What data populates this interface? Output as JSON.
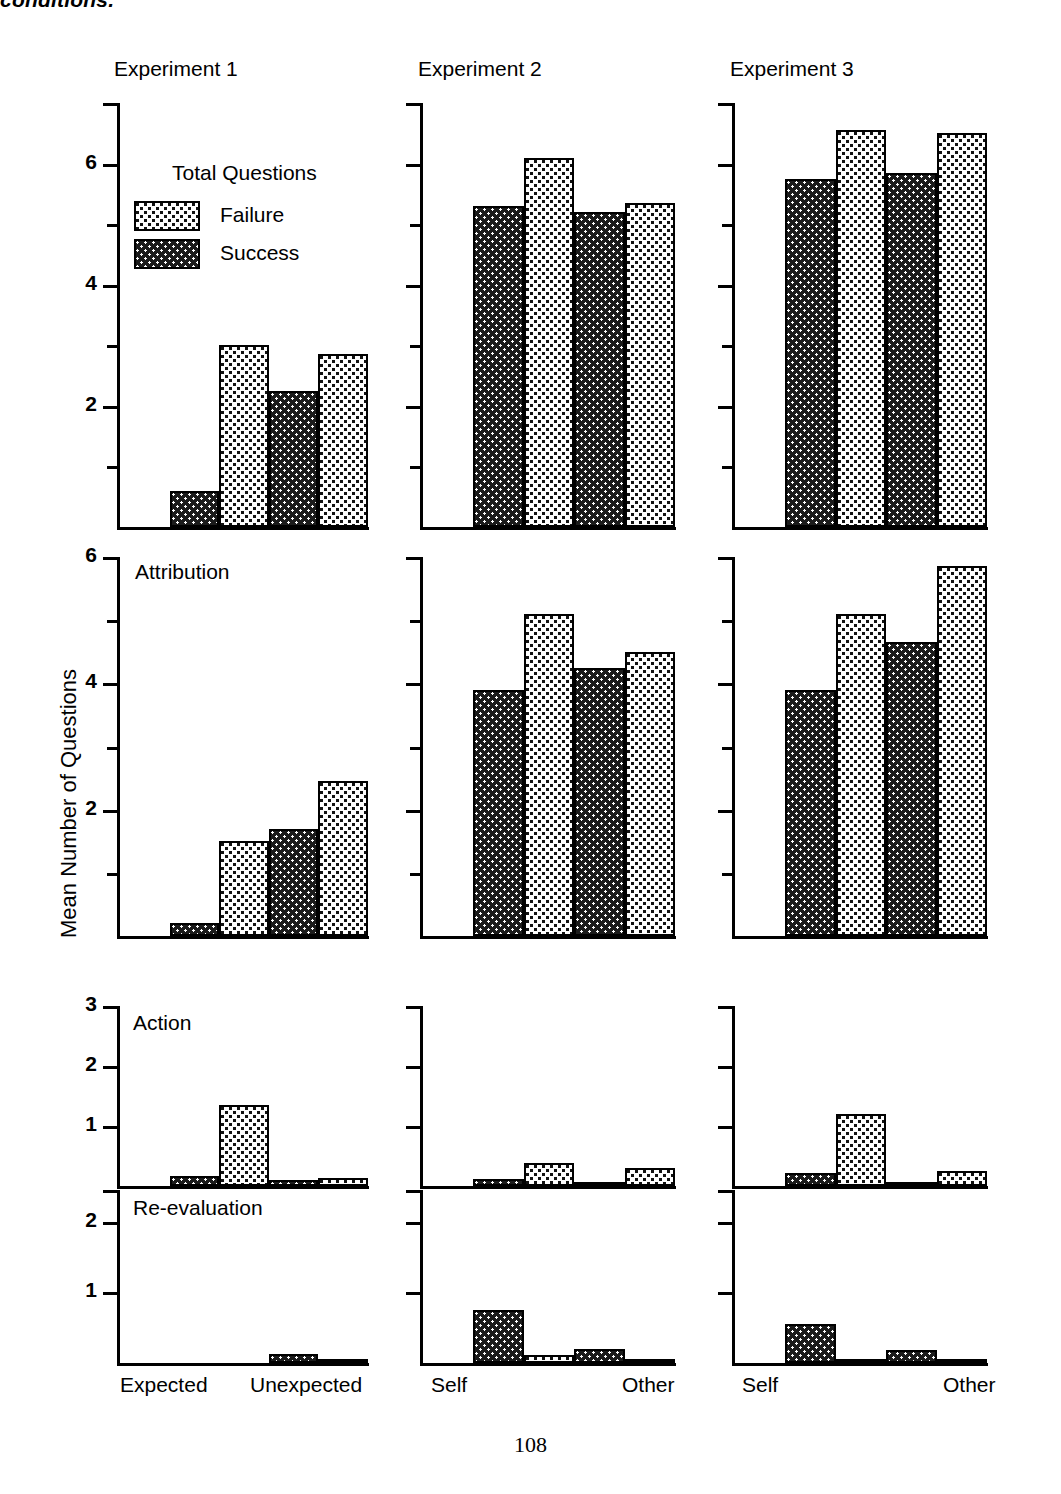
{
  "caption": {
    "clipped_text": "conditions."
  },
  "page_number": "108",
  "axis": {
    "ylabel": "Mean Number of Questions"
  },
  "legend": {
    "title": "Total Questions",
    "entries": [
      {
        "label": "Failure",
        "pattern": "light-dotted"
      },
      {
        "label": "Success",
        "pattern": "dark-dotted"
      }
    ]
  },
  "columns": [
    {
      "title": "Experiment 1",
      "x_labels": [
        "Expected",
        "Unexpected"
      ]
    },
    {
      "title": "Experiment 2",
      "x_labels": [
        "Self",
        "Other"
      ]
    },
    {
      "title": "Experiment 3",
      "x_labels": [
        "Self",
        "Other"
      ]
    }
  ],
  "rows": [
    {
      "title": "",
      "ymax": 7,
      "major_ticks": [
        2,
        4,
        6
      ],
      "minor_ticks": [
        1,
        3,
        5
      ]
    },
    {
      "title": "Attribution",
      "ymax": 6,
      "major_ticks": [
        2,
        4,
        6
      ],
      "minor_ticks": [
        1,
        3,
        5
      ]
    },
    {
      "title": "Action",
      "ymax": 3,
      "major_ticks": [
        1,
        2,
        3
      ],
      "minor_ticks": []
    },
    {
      "title": "Re-evaluation",
      "ymax": 2.45,
      "major_ticks": [
        1,
        2
      ],
      "minor_ticks": []
    }
  ],
  "chart_data": {
    "type": "bar",
    "xlabel": "",
    "ylabel": "Mean Number of Questions",
    "grid": false,
    "legend_position": "inside-top-left-of-panel-1-row-1",
    "legend_title": "Total Questions",
    "series": [
      {
        "name": "Success",
        "pattern": "dark-dotted"
      },
      {
        "name": "Failure",
        "pattern": "light-dotted"
      }
    ],
    "bar_order": [
      "Success",
      "Failure",
      "Success",
      "Failure"
    ],
    "panels": [
      {
        "row": "Total Questions",
        "ylim": [
          0,
          7
        ],
        "yticks": [
          2,
          4,
          6
        ],
        "columns": [
          {
            "experiment": "Experiment 1",
            "groups": [
              "Expected",
              "Unexpected"
            ],
            "values": [
              {
                "group": "Expected",
                "series": "Success",
                "value": 0.6
              },
              {
                "group": "Expected",
                "series": "Failure",
                "value": 3.0
              },
              {
                "group": "Unexpected",
                "series": "Success",
                "value": 2.25
              },
              {
                "group": "Unexpected",
                "series": "Failure",
                "value": 2.85
              }
            ]
          },
          {
            "experiment": "Experiment 2",
            "groups": [
              "Self",
              "Other"
            ],
            "values": [
              {
                "group": "Self",
                "series": "Success",
                "value": 5.3
              },
              {
                "group": "Self",
                "series": "Failure",
                "value": 6.1
              },
              {
                "group": "Other",
                "series": "Success",
                "value": 5.2
              },
              {
                "group": "Other",
                "series": "Failure",
                "value": 5.35
              }
            ]
          },
          {
            "experiment": "Experiment 3",
            "groups": [
              "Self",
              "Other"
            ],
            "values": [
              {
                "group": "Self",
                "series": "Success",
                "value": 5.75
              },
              {
                "group": "Self",
                "series": "Failure",
                "value": 6.55
              },
              {
                "group": "Other",
                "series": "Success",
                "value": 5.85
              },
              {
                "group": "Other",
                "series": "Failure",
                "value": 6.5
              }
            ]
          }
        ]
      },
      {
        "row": "Attribution",
        "ylim": [
          0,
          6
        ],
        "yticks": [
          2,
          4,
          6
        ],
        "columns": [
          {
            "experiment": "Experiment 1",
            "groups": [
              "Expected",
              "Unexpected"
            ],
            "values": [
              {
                "group": "Expected",
                "series": "Success",
                "value": 0.2
              },
              {
                "group": "Expected",
                "series": "Failure",
                "value": 1.5
              },
              {
                "group": "Unexpected",
                "series": "Success",
                "value": 1.7
              },
              {
                "group": "Unexpected",
                "series": "Failure",
                "value": 2.45
              }
            ]
          },
          {
            "experiment": "Experiment 2",
            "groups": [
              "Self",
              "Other"
            ],
            "values": [
              {
                "group": "Self",
                "series": "Success",
                "value": 3.9
              },
              {
                "group": "Self",
                "series": "Failure",
                "value": 5.1
              },
              {
                "group": "Other",
                "series": "Success",
                "value": 4.25
              },
              {
                "group": "Other",
                "series": "Failure",
                "value": 4.5
              }
            ]
          },
          {
            "experiment": "Experiment 3",
            "groups": [
              "Self",
              "Other"
            ],
            "values": [
              {
                "group": "Self",
                "series": "Success",
                "value": 3.9
              },
              {
                "group": "Self",
                "series": "Failure",
                "value": 5.1
              },
              {
                "group": "Other",
                "series": "Success",
                "value": 4.65
              },
              {
                "group": "Other",
                "series": "Failure",
                "value": 5.85
              }
            ]
          }
        ]
      },
      {
        "row": "Action",
        "ylim": [
          0,
          3
        ],
        "yticks": [
          1,
          2,
          3
        ],
        "columns": [
          {
            "experiment": "Experiment 1",
            "groups": [
              "Expected",
              "Unexpected"
            ],
            "values": [
              {
                "group": "Expected",
                "series": "Success",
                "value": 0.17
              },
              {
                "group": "Expected",
                "series": "Failure",
                "value": 1.35
              },
              {
                "group": "Unexpected",
                "series": "Success",
                "value": 0.1
              },
              {
                "group": "Unexpected",
                "series": "Failure",
                "value": 0.13
              }
            ]
          },
          {
            "experiment": "Experiment 2",
            "groups": [
              "Self",
              "Other"
            ],
            "values": [
              {
                "group": "Self",
                "series": "Success",
                "value": 0.12
              },
              {
                "group": "Self",
                "series": "Failure",
                "value": 0.38
              },
              {
                "group": "Other",
                "series": "Success",
                "value": 0.04
              },
              {
                "group": "Other",
                "series": "Failure",
                "value": 0.3
              }
            ]
          },
          {
            "experiment": "Experiment 3",
            "groups": [
              "Self",
              "Other"
            ],
            "values": [
              {
                "group": "Self",
                "series": "Success",
                "value": 0.22
              },
              {
                "group": "Self",
                "series": "Failure",
                "value": 1.2
              },
              {
                "group": "Other",
                "series": "Success",
                "value": 0.06
              },
              {
                "group": "Other",
                "series": "Failure",
                "value": 0.25
              }
            ]
          }
        ]
      },
      {
        "row": "Re-evaluation",
        "ylim": [
          0,
          2.45
        ],
        "yticks": [
          1,
          2
        ],
        "columns": [
          {
            "experiment": "Experiment 1",
            "groups": [
              "Expected",
              "Unexpected"
            ],
            "values": [
              {
                "group": "Expected",
                "series": "Success",
                "value": 0.0
              },
              {
                "group": "Expected",
                "series": "Failure",
                "value": 0.0
              },
              {
                "group": "Unexpected",
                "series": "Success",
                "value": 0.13
              },
              {
                "group": "Unexpected",
                "series": "Failure",
                "value": 0.05
              }
            ]
          },
          {
            "experiment": "Experiment 2",
            "groups": [
              "Self",
              "Other"
            ],
            "values": [
              {
                "group": "Self",
                "series": "Success",
                "value": 0.75
              },
              {
                "group": "Self",
                "series": "Failure",
                "value": 0.12
              },
              {
                "group": "Other",
                "series": "Success",
                "value": 0.2
              },
              {
                "group": "Other",
                "series": "Failure",
                "value": 0.05
              }
            ]
          },
          {
            "experiment": "Experiment 3",
            "groups": [
              "Self",
              "Other"
            ],
            "values": [
              {
                "group": "Self",
                "series": "Success",
                "value": 0.55
              },
              {
                "group": "Self",
                "series": "Failure",
                "value": 0.03
              },
              {
                "group": "Other",
                "series": "Success",
                "value": 0.18
              },
              {
                "group": "Other",
                "series": "Failure",
                "value": 0.02
              }
            ]
          }
        ]
      }
    ]
  }
}
